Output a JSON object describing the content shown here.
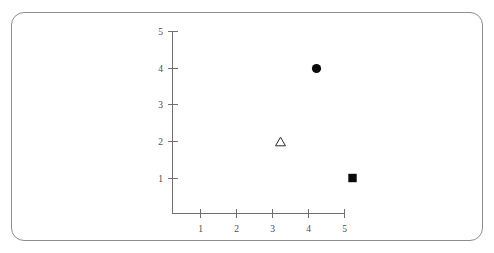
{
  "figure": {
    "background_color": "#ffffff",
    "border_color": "#8d8d8d",
    "axis_color": "#6f6f6f",
    "label_color": "#4a4a4a",
    "marker_color": "#0a0a0a"
  },
  "chart_data": {
    "type": "scatter",
    "title": "",
    "xlabel": "",
    "ylabel": "",
    "xlim": [
      0,
      5
    ],
    "ylim": [
      0,
      5
    ],
    "grid": false,
    "legend": "none",
    "xticks": [
      "1",
      "2",
      "3",
      "4",
      "5"
    ],
    "xtick_values": [
      1,
      2,
      3,
      4,
      5
    ],
    "yticks": [
      "1",
      "2",
      "3",
      "4",
      "5"
    ],
    "ytick_values": [
      1,
      2,
      3,
      4,
      5
    ],
    "points": [
      {
        "x": 4,
        "y": 4,
        "marker": "circle",
        "filled": true,
        "label": "filled-circle-marker"
      },
      {
        "x": 3,
        "y": 2,
        "marker": "triangle",
        "filled": false,
        "label": "open-triangle-marker"
      },
      {
        "x": 5,
        "y": 1,
        "marker": "square",
        "filled": true,
        "label": "filled-square-marker"
      }
    ],
    "series": [
      {
        "name": "circle",
        "x": [
          4
        ],
        "y": [
          4
        ]
      },
      {
        "name": "triangle",
        "x": [
          3
        ],
        "y": [
          2
        ]
      },
      {
        "name": "square",
        "x": [
          5
        ],
        "y": [
          1
        ]
      }
    ]
  }
}
